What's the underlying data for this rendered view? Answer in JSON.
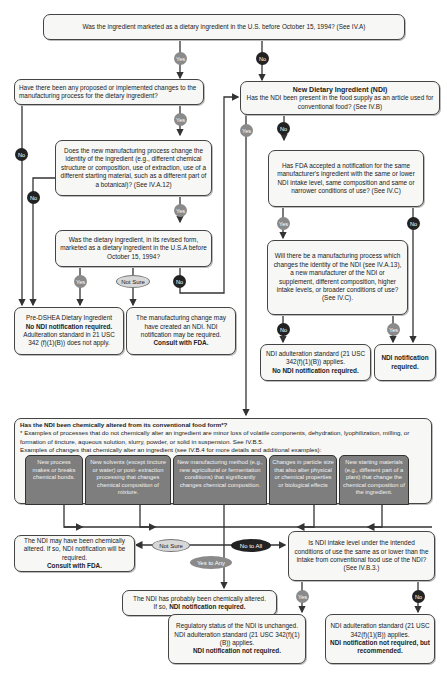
{
  "colors": {
    "yes": "#8a8a8a",
    "no": "#222222",
    "not_sure": "#d8d8d8",
    "box_bg": "#f7f7f5",
    "cell_bg": "#7e7e7e"
  },
  "labels": {
    "yes": "Yes",
    "no": "No",
    "not_sure": "Not Sure",
    "no_to_all": "No to All",
    "yes_to_any": "Yes to Any"
  },
  "nodes": {
    "q1": "Was the ingredient marketed as a dietary ingredient in the U.S. before October 15, 1994?  (See IV.A)",
    "q2": "Have there been any proposed or implemented changes to the manufacturing process for the dietary ingredient?",
    "q3": "Does the new manufacturing process change the identity of the ingredient (e.g., different chemical structure or composition, use of extraction, use of a different starting material, such as a different part of a botanical)? (See IV.A.12)",
    "q4": "Was the dietary ingredient, in its revised form, marketed as a dietary ingredient in the U.S.A before October 15, 1994?",
    "r_predshea": {
      "l1": "Pre-DSHEA Dietary Ingredient",
      "l2": "No NDI notification required.",
      "l3": "Adulteration standard in 21 USC 342 (f)(1)(B)) does not apply."
    },
    "r_consult1": {
      "l1": "The manufacturing change may have created an NDI.  NDI notification may be required.",
      "l2": "Consult with FDA."
    },
    "ndi": {
      "title": "New Dietary Ingredient (NDI)",
      "text": "Has the NDI been present in the food supply as an article used for conventional food? (See IV.B)"
    },
    "q5": "Has FDA accepted a notification for the same manufacturer's ingredient with the same or lower NDI intake level, same composition and same or narrower conditions of use? (See IV.C)",
    "q6": "Will there be a manufacturing process which changes the identity of the NDI (see IV.A.13), a new manufacturer of the NDI or supplement, different composition, higher intake levels, or broader conditions of use?  (See  IV.C).",
    "r_adult1": {
      "l1": "NDI adulteration standard (21 USC 342(f)(1)(B)) applies.",
      "l2": "No NDI notification required."
    },
    "r_notif": "NDI notification required.",
    "chem": {
      "question": "Has the NDI been chemically altered from its conventional food form*?",
      "note": "* Examples of processes that do not chemically alter an ingredient are minor loss of volatile components, dehydration, lyophilization, milling, or formation of tincture, aqueous solution, slurry, powder, or solid in suspension. See IV.B.5.",
      "examples_intro": "Examples of changes that chemically alter an ingredient (see IV.B.4 for more details and additional examples):",
      "cells": [
        "New process makes or breaks chemical bonds.",
        "New solvents (except tincture or water) or post- extraction processing that changes chemical composition of mixture.",
        "New manufacturing method (e.g., new agricultural or fermentation conditions) that significantly changes chemical composition.",
        "Changes in particle size that also alter physical or chemical properties or biological effects",
        "New starting materials (e.g., different part of a plant) that change the chemical composition of the ingredient."
      ]
    },
    "r_consult2": {
      "l1": "The NDI may have been chemically altered.  If so, NDI notification will be required.",
      "l2": "Consult with FDA."
    },
    "q7": "Is NDI intake level under the intended conditions of use the same as or lower than the intake from conventional food use of the NDI? (See IV.B.3.)",
    "r_altered": {
      "l1": "The NDI has probably been chemically altered.",
      "l2a": "If so, ",
      "l2b": "NDI notification required."
    },
    "r_unchanged": {
      "l1": "Regulatory status of the NDI is unchanged. NDI adulteration standard  (21 USC 342(f)(1)(B)) applies.",
      "l2": "NDI notification not required."
    },
    "r_recommended": {
      "l1": "NDI adulteration standard (21 USC 342(f)(1)(B)) applies.",
      "l2": "NDI notification not required, but recommended."
    }
  }
}
